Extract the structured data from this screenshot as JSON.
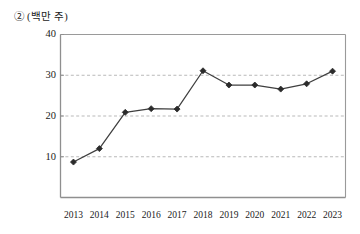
{
  "chart_data": {
    "type": "line",
    "title": "② (백만 주)",
    "title_marker": "②",
    "title_unit": "(백만 주)",
    "xlabel": "",
    "ylabel": "(백만 주)",
    "categories": [
      "2013",
      "2014",
      "2015",
      "2016",
      "2017",
      "2018",
      "2019",
      "2020",
      "2021",
      "2022",
      "2023"
    ],
    "values": [
      8.7,
      12.0,
      20.9,
      21.8,
      21.7,
      31.1,
      27.6,
      27.6,
      26.6,
      27.9,
      31.0
    ],
    "series": [
      {
        "name": "거래량",
        "values": [
          8.7,
          12.0,
          20.9,
          21.8,
          21.7,
          31.1,
          27.6,
          27.6,
          26.6,
          27.9,
          31.0
        ]
      }
    ],
    "ylim": [
      0,
      40
    ],
    "ytick_labels": [
      "10",
      "20",
      "30",
      "40"
    ],
    "yticks": [
      10,
      20,
      30,
      40
    ],
    "xtick_labels": [
      "2013",
      "2014",
      "2015",
      "2016",
      "2017",
      "2018",
      "2019",
      "2020",
      "2021",
      "2022",
      "2023"
    ],
    "grid": true,
    "grid_style": "dashed-horizontal",
    "legend": false,
    "legend_position": "none",
    "marker": "diamond",
    "colors": {
      "line": "#3f3f3f",
      "marker": "#2b2b2b",
      "grid": "#b9b9b9",
      "frame": "#9a9a9a",
      "text": "#1a1a1a",
      "background": "#ffffff"
    }
  }
}
